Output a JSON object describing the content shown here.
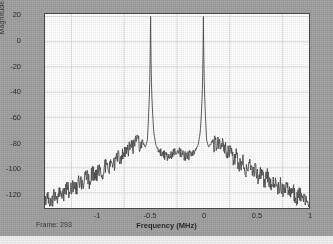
{
  "figure": {
    "background_color": "#a2a2a2",
    "axes_background_color": "#ffffff",
    "axes_border_color": "#4a4a4a",
    "grid_color": "#d9d9d9",
    "trace_color": "#4d4d4d",
    "frame_status": "Frame: 293"
  },
  "chart_data": {
    "type": "line",
    "title": "",
    "subtitle": "",
    "xlabel": "Frequency (MHz)",
    "ylabel": "Magnitude-squared, dB",
    "xlim": [
      -1.25,
      1.25
    ],
    "ylim": [
      -132,
      22
    ],
    "xticks": [
      -1,
      -0.5,
      0,
      0.5,
      1
    ],
    "xticklabels": [
      "-1",
      "-0.5",
      "0",
      "0.5",
      "1"
    ],
    "yticks": [
      20,
      0,
      -20,
      -40,
      -60,
      -80,
      -100,
      -120
    ],
    "yticklabels": [
      "20",
      "0",
      "-20",
      "-40",
      "-60",
      "-80",
      "-100",
      "-120"
    ],
    "grid": true,
    "legend": null,
    "annotations": [
      {
        "text": "Frame: 293",
        "position": "bottom-left"
      }
    ],
    "series": [
      {
        "name": "magnitude-squared spectrum",
        "color": "#4d4d4d",
        "description": "Noisy power spectrum with two narrow tones at -0.25 and +0.25 MHz reaching about +20 dB, over a noise floor that peaks near -78 dB at +/-0.55 MHz and rolls off to about -128 dB at the band edges.",
        "x": [
          -1.25,
          -1.22,
          -1.19,
          -1.16,
          -1.13,
          -1.1,
          -1.07,
          -1.04,
          -1.01,
          -0.98,
          -0.95,
          -0.92,
          -0.89,
          -0.86,
          -0.83,
          -0.8,
          -0.77,
          -0.74,
          -0.71,
          -0.68,
          -0.65,
          -0.62,
          -0.59,
          -0.56,
          -0.53,
          -0.5,
          -0.47,
          -0.44,
          -0.41,
          -0.38,
          -0.35,
          -0.32,
          -0.3,
          -0.28,
          -0.27,
          -0.26,
          -0.255,
          -0.25,
          -0.245,
          -0.24,
          -0.23,
          -0.22,
          -0.2,
          -0.18,
          -0.15,
          -0.12,
          -0.09,
          -0.06,
          -0.03,
          0.0,
          0.03,
          0.06,
          0.09,
          0.12,
          0.15,
          0.18,
          0.2,
          0.22,
          0.23,
          0.24,
          0.245,
          0.25,
          0.255,
          0.26,
          0.27,
          0.28,
          0.3,
          0.32,
          0.35,
          0.38,
          0.41,
          0.44,
          0.47,
          0.5,
          0.53,
          0.56,
          0.59,
          0.62,
          0.65,
          0.68,
          0.71,
          0.74,
          0.77,
          0.8,
          0.83,
          0.86,
          0.89,
          0.92,
          0.95,
          0.98,
          1.01,
          1.04,
          1.07,
          1.1,
          1.13,
          1.16,
          1.19,
          1.22,
          1.25
        ],
        "y": [
          -128,
          -124,
          -127,
          -121,
          -125,
          -118,
          -122,
          -115,
          -120,
          -112,
          -117,
          -110,
          -114,
          -106,
          -112,
          -103,
          -108,
          -100,
          -105,
          -97,
          -102,
          -94,
          -98,
          -90,
          -94,
          -86,
          -88,
          -82,
          -84,
          -79,
          -82,
          -80,
          -84,
          -78,
          -60,
          -40,
          -20,
          20,
          -20,
          -40,
          -58,
          -72,
          -82,
          -86,
          -88,
          -90,
          -92,
          -90,
          -88,
          -86,
          -88,
          -90,
          -92,
          -90,
          -88,
          -86,
          -82,
          -72,
          -58,
          -40,
          -20,
          20,
          -20,
          -40,
          -60,
          -78,
          -84,
          -80,
          -82,
          -79,
          -84,
          -82,
          -88,
          -86,
          -94,
          -90,
          -98,
          -94,
          -102,
          -97,
          -105,
          -100,
          -108,
          -103,
          -112,
          -106,
          -114,
          -110,
          -117,
          -112,
          -120,
          -115,
          -122,
          -118,
          -125,
          -121,
          -127,
          -124,
          -128
        ]
      }
    ]
  }
}
